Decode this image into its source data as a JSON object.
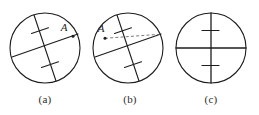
{
  "figure": {
    "background_color": "#ffffff",
    "stroke_color": "#1d1d1d",
    "dash_color": "#6b6b6b",
    "width": 259,
    "height": 115,
    "panels": [
      {
        "id": "a",
        "caption": "(a)",
        "circle": {
          "cx": 45,
          "cy": 48,
          "r": 35
        },
        "chords": [
          {
            "name": "chord-through-A",
            "x1": 12,
            "y1": 57,
            "x2": 78,
            "y2": 34,
            "tick_count": 0,
            "style": "solid"
          },
          {
            "name": "chord-vertical-ticked",
            "x1": 34,
            "y1": 15,
            "x2": 56,
            "y2": 81,
            "tick_count": 2,
            "style": "solid"
          }
        ],
        "points": [
          {
            "name": "point-A",
            "label": "A",
            "x": 73,
            "y": 36,
            "label_x": 64,
            "label_y": 31
          }
        ]
      },
      {
        "id": "b",
        "caption": "(b)",
        "circle": {
          "cx": 128,
          "cy": 48,
          "r": 35
        },
        "chords": [
          {
            "name": "chord-lower-left",
            "x1": 95,
            "y1": 57,
            "x2": 161,
            "y2": 34,
            "tick_count": 0,
            "style": "solid"
          },
          {
            "name": "chord-vertical-ticked",
            "x1": 117,
            "y1": 15,
            "x2": 139,
            "y2": 81,
            "tick_count": 2,
            "style": "solid"
          },
          {
            "name": "dashed-construction-line",
            "x1": 105,
            "y1": 38,
            "x2": 161,
            "y2": 34,
            "tick_count": 0,
            "style": "dashed"
          }
        ],
        "points": [
          {
            "name": "point-A",
            "label": "A",
            "x": 105,
            "y": 38,
            "label_x": 100,
            "label_y": 32
          }
        ]
      },
      {
        "id": "c",
        "caption": "(c)",
        "circle": {
          "cx": 211,
          "cy": 48,
          "r": 35
        },
        "chords": [
          {
            "name": "horizontal-diameter",
            "x1": 176,
            "y1": 48,
            "x2": 246,
            "y2": 48,
            "tick_count": 0,
            "style": "solid"
          },
          {
            "name": "vertical-diameter-ticked",
            "x1": 211,
            "y1": 13,
            "x2": 211,
            "y2": 83,
            "tick_count": 2,
            "style": "solid"
          }
        ],
        "points": []
      }
    ]
  }
}
